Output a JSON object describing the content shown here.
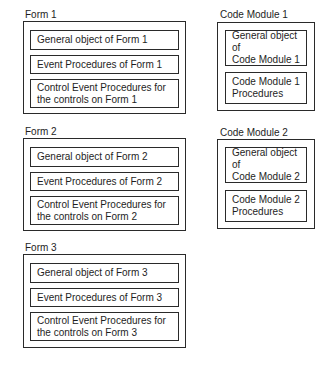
{
  "forms": [
    {
      "title": "Form 1",
      "items": [
        "General object of Form 1",
        "Event Procedures  of Form 1",
        "Control Event Procedures for\nthe controls on Form 1"
      ]
    },
    {
      "title": "Form 2",
      "items": [
        "General object of Form 2",
        "Event Procedures  of Form 2",
        "Control Event Procedures for\nthe controls on Form 2"
      ]
    },
    {
      "title": "Form 3",
      "items": [
        "General object of Form 3",
        "Event Procedures  of Form 3",
        "Control Event Procedures for\nthe controls on Form 3"
      ]
    }
  ],
  "modules": [
    {
      "title": "Code Module 1",
      "items": [
        "General object of\nCode Module 1",
        "Code Module 1\nProcedures"
      ]
    },
    {
      "title": "Code Module 2",
      "items": [
        "General object of\nCode Module 2",
        "Code Module 2\nProcedures"
      ]
    }
  ]
}
